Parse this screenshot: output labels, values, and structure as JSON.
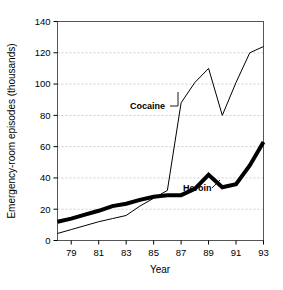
{
  "chart_data": {
    "type": "line",
    "title": "",
    "xlabel": "Year",
    "ylabel": "Emergency-room episodes (thousands)",
    "xlim": [
      78,
      93
    ],
    "ylim": [
      0,
      140
    ],
    "ytick_values": [
      0,
      20,
      40,
      60,
      80,
      100,
      120,
      140
    ],
    "ytick_labels": [
      "0",
      "20",
      "40",
      "60",
      "80",
      "100",
      "120",
      "140"
    ],
    "xtick_values": [
      79,
      81,
      83,
      85,
      87,
      89,
      91,
      93
    ],
    "xtick_labels": [
      "79",
      "81",
      "83",
      "85",
      "87",
      "89",
      "91",
      "93"
    ],
    "grid": "horizontal-dashed",
    "legend_position": "inline-annotations",
    "x": [
      78,
      79,
      80,
      81,
      82,
      83,
      84,
      85,
      86,
      87,
      88,
      89,
      90,
      91,
      92,
      93
    ],
    "series": [
      {
        "name": "Cocaine",
        "color": "#000000",
        "line_width": 1,
        "label_text": "Cocaine",
        "values": [
          4.5,
          7,
          9.5,
          12,
          14,
          16,
          22,
          27,
          32,
          88,
          101,
          110,
          80,
          101,
          120,
          124
        ]
      },
      {
        "name": "Heroin",
        "color": "#000000",
        "line_width": 4,
        "label_text": "Heroin",
        "values": [
          12,
          14,
          16.5,
          19,
          22,
          23.5,
          26,
          28,
          29,
          29,
          33,
          42,
          34,
          36,
          48,
          63
        ]
      }
    ]
  },
  "annotations": {
    "cocaine": {
      "text": "Cocaine"
    },
    "heroin": {
      "text": "Heroin"
    }
  }
}
